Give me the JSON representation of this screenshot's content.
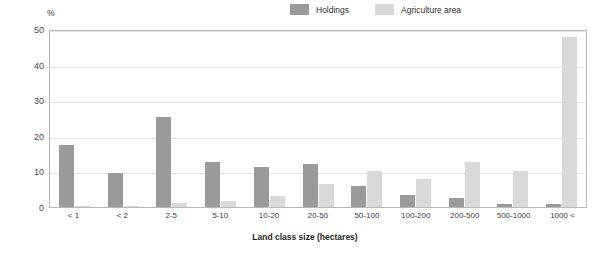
{
  "chart_data": {
    "type": "bar",
    "title": "",
    "subtitle": "",
    "xlabel": "Land class size (hectares)",
    "ylabel": "%",
    "ylim": [
      0,
      50
    ],
    "yticks": [
      0,
      10,
      20,
      30,
      40,
      50
    ],
    "grid": true,
    "legend_position": "top-right",
    "categories": [
      "< 1",
      "< 2",
      "2-5",
      "5-10",
      "10-20",
      "20-50",
      "50-100",
      "100-200",
      "200-500",
      "500-1000",
      "1000 <"
    ],
    "series": [
      {
        "name": "Holdings",
        "color": "#9a9a9a",
        "values": [
          17.3,
          9.5,
          25.2,
          12.6,
          11.3,
          12.0,
          5.8,
          3.3,
          2.4,
          0.8,
          0.8
        ]
      },
      {
        "name": "Agriculture area",
        "color": "#d9d9d9",
        "values": [
          0.3,
          0.3,
          1.1,
          1.8,
          3.0,
          6.6,
          10.1,
          8.0,
          12.6,
          10.2,
          47.7
        ]
      }
    ]
  },
  "legend": {
    "items": [
      {
        "label": "Holdings"
      },
      {
        "label": "Agriculture area"
      }
    ]
  },
  "axes": {
    "y_unit": "%",
    "x_title": "Land class size (hectares)",
    "y_tick_labels": [
      "0",
      "10",
      "20",
      "30",
      "40",
      "50"
    ]
  }
}
